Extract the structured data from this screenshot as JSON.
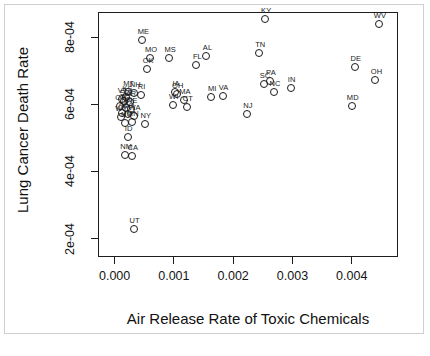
{
  "chart_data": {
    "type": "scatter",
    "title": "",
    "xlabel": "Air Release Rate of Toxic Chemicals",
    "ylabel": "Lung Cancer Death Rate",
    "xlim": [
      -0.00028,
      0.00478
    ],
    "ylim": [
      0.000145,
      0.000875
    ],
    "xticks": [
      0.0,
      0.001,
      0.002,
      0.003,
      0.004
    ],
    "xticklabels": [
      "0.000",
      "0.001",
      "0.002",
      "0.003",
      "0.004"
    ],
    "yticks": [
      0.0002,
      0.0004,
      0.0006,
      0.0008
    ],
    "yticklabels": [
      "2e-04",
      "4e-04",
      "6e-04",
      "8e-04"
    ],
    "grid": false,
    "legend": false,
    "marker": "open-circle",
    "point_label_position": "above",
    "points": [
      {
        "label": "ME",
        "x": 0.00047,
        "y": 0.000792
      },
      {
        "label": "MO",
        "x": 0.0006,
        "y": 0.000738
      },
      {
        "label": "OK",
        "x": 0.00055,
        "y": 0.000705
      },
      {
        "label": "MS",
        "x": 0.00092,
        "y": 0.000737
      },
      {
        "label": "FL",
        "x": 0.00138,
        "y": 0.000718
      },
      {
        "label": "AL",
        "x": 0.00155,
        "y": 0.000743
      },
      {
        "label": "KY",
        "x": 0.00254,
        "y": 0.000855
      },
      {
        "label": "TN",
        "x": 0.00244,
        "y": 0.000752
      },
      {
        "label": "WV",
        "x": 0.00446,
        "y": 0.000838
      },
      {
        "label": "DE",
        "x": 0.00405,
        "y": 0.00071
      },
      {
        "label": "OH",
        "x": 0.0044,
        "y": 0.000673
      },
      {
        "label": "SC",
        "x": 0.00252,
        "y": 0.00066
      },
      {
        "label": "PA",
        "x": 0.00262,
        "y": 0.000668
      },
      {
        "label": "NC",
        "x": 0.00269,
        "y": 0.000637
      },
      {
        "label": "IN",
        "x": 0.00297,
        "y": 0.00065
      },
      {
        "label": "MD",
        "x": 0.004,
        "y": 0.000596
      },
      {
        "label": "NJ",
        "x": 0.00223,
        "y": 0.000572
      },
      {
        "label": "MT",
        "x": 0.00022,
        "y": 0.000637
      },
      {
        "label": "NH",
        "x": 0.00033,
        "y": 0.000633
      },
      {
        "label": "RI",
        "x": 0.00044,
        "y": 0.000627
      },
      {
        "label": "IA",
        "x": 0.00102,
        "y": 0.000636
      },
      {
        "label": "OH2",
        "x": 0.00105,
        "y": 0.00063
      },
      {
        "label": "MA",
        "x": 0.00117,
        "y": 0.000614
      },
      {
        "label": "WI",
        "x": 0.00098,
        "y": 0.000598
      },
      {
        "label": "CT",
        "x": 0.00122,
        "y": 0.000592
      },
      {
        "label": "MI",
        "x": 0.00163,
        "y": 0.000622
      },
      {
        "label": "VA",
        "x": 0.00182,
        "y": 0.000625
      },
      {
        "label": "KS",
        "x": 0.0002,
        "y": 0.000621
      },
      {
        "label": "VT",
        "x": 0.00012,
        "y": 0.000616
      },
      {
        "label": "SD",
        "x": 0.00016,
        "y": 0.00061
      },
      {
        "label": "AR",
        "x": 0.00026,
        "y": 0.000607
      },
      {
        "label": "OR",
        "x": 9e-05,
        "y": 0.000596
      },
      {
        "label": "ND",
        "x": 0.00019,
        "y": 0.00059
      },
      {
        "label": "NE",
        "x": 0.00028,
        "y": 0.000585
      },
      {
        "label": "AZ",
        "x": 0.00013,
        "y": 0.000574
      },
      {
        "label": "CO",
        "x": 0.00022,
        "y": 0.00057
      },
      {
        "label": "WA",
        "x": 0.00032,
        "y": 0.000566
      },
      {
        "label": "WY",
        "x": 0.0001,
        "y": 0.000561
      },
      {
        "label": "MN",
        "x": 0.00029,
        "y": 0.000548
      },
      {
        "label": "NV",
        "x": 0.00018,
        "y": 0.000545
      },
      {
        "label": "NY",
        "x": 0.00051,
        "y": 0.000542
      },
      {
        "label": "ID",
        "x": 0.00022,
        "y": 0.000502
      },
      {
        "label": "NM",
        "x": 0.00018,
        "y": 0.000448
      },
      {
        "label": "CA",
        "x": 0.00029,
        "y": 0.000445
      },
      {
        "label": "UT",
        "x": 0.00032,
        "y": 0.000228
      }
    ]
  }
}
